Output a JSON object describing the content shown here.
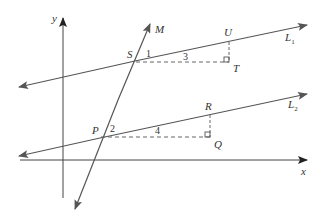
{
  "diagram": {
    "axes": {
      "x_label": "x",
      "y_label": "y"
    },
    "lines": {
      "L1": {
        "label": "L",
        "subscript": "1"
      },
      "L2": {
        "label": "L",
        "subscript": "2"
      },
      "M": {
        "label": "M"
      }
    },
    "points": {
      "S": "S",
      "T": "T",
      "U": "U",
      "P": "P",
      "Q": "Q",
      "R": "R"
    },
    "angles": {
      "a1": "1",
      "a2": "2",
      "a3": "3",
      "a4": "4"
    },
    "colors": {
      "line": "#555555",
      "axis": "#444444",
      "dashed": "#666666"
    }
  }
}
